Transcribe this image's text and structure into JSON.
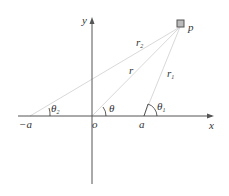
{
  "diagram": {
    "type": "coordinate-geometry",
    "colors": {
      "axis": "#555555",
      "ray": "#d9d9d9",
      "arc": "#333333",
      "point_fill": "#bbbbbb",
      "point_stroke": "#555555",
      "text": "#333333"
    },
    "axes": {
      "x_label": "x",
      "y_label": "y",
      "origin_label": "o"
    },
    "points": {
      "p_label": "p",
      "neg_a_label": "−a",
      "a_label": "a"
    },
    "rays": {
      "r_label": "r",
      "r1_label": "r",
      "r1_sub": "1",
      "r2_label": "r",
      "r2_sub": "2"
    },
    "angles": {
      "theta_label": "θ",
      "theta1_label": "θ",
      "theta1_sub": "1",
      "theta2_label": "θ",
      "theta2_sub": "2"
    }
  }
}
